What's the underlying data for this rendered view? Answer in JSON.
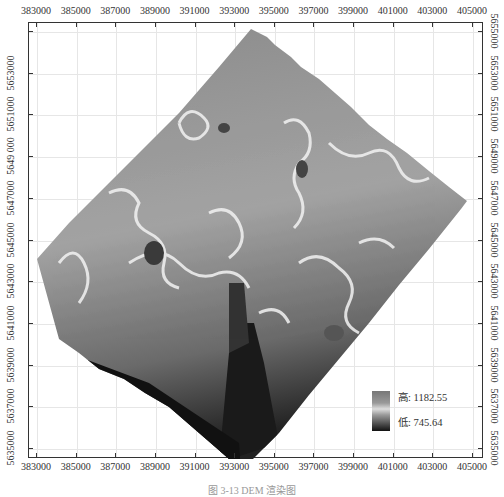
{
  "map": {
    "type": "DEM grayscale elevation rendering",
    "x_ticks": [
      "383000",
      "385000",
      "387000",
      "389000",
      "391000",
      "393000",
      "395000",
      "397000",
      "399000",
      "401000",
      "403000",
      "405000"
    ],
    "y_ticks_left": [
      "5653000",
      "5651000",
      "5649 000",
      "5647000",
      "5645000",
      "5643000",
      "5641000",
      "5639000",
      "5637000",
      "5635000"
    ],
    "y_ticks_right": [
      "5655000",
      "5653000",
      "5651000",
      "5649000",
      "5647000",
      "5645000",
      "5643000",
      "5641000",
      "5639000",
      "5637000",
      "5635000"
    ],
    "legend": {
      "high_label": "高: 1182.55",
      "low_label": "低: 745.64",
      "high_value": 1182.55,
      "low_value": 745.64
    },
    "colors": {
      "frame": "#333333",
      "grid": "#e6e6e6",
      "dem_high": "#eeeeee",
      "dem_mid": "#9a9a9a",
      "dem_low": "#111111"
    }
  },
  "caption": "图 3-13   DEM 渲染图"
}
